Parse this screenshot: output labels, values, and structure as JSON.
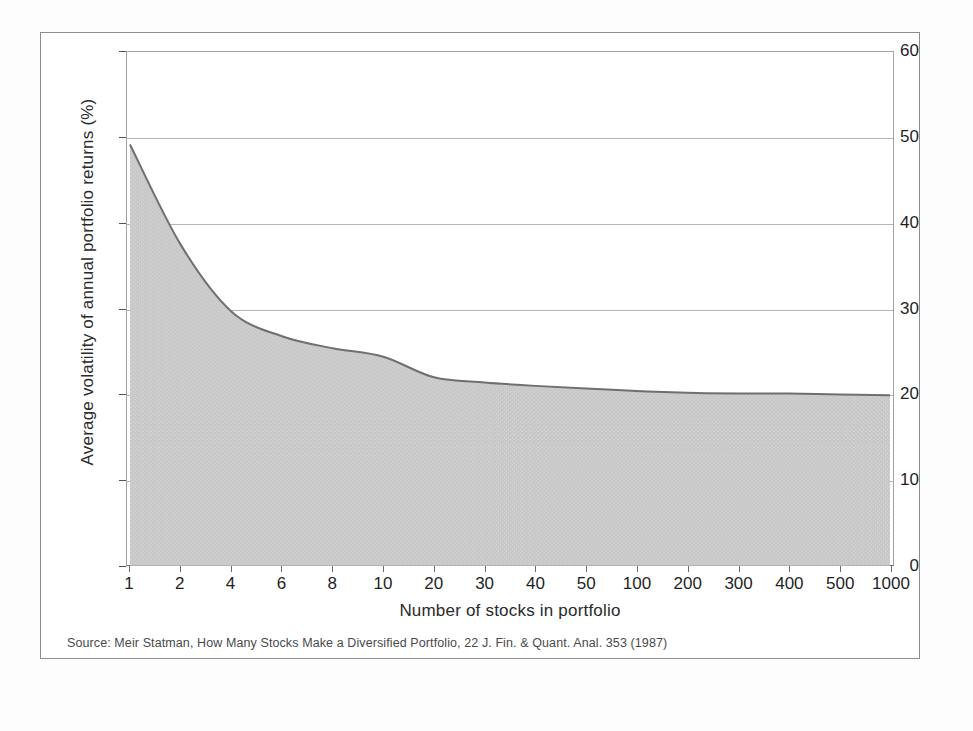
{
  "figure": {
    "source_note": "Source: Meir Statman, How Many Stocks Make a Diversified Portfolio, 22 J. Fin. & Quant. Anal. 353 (1987)",
    "frame_color": "#8e8e8e",
    "plot_border_color": "#a3a3a3",
    "gridline_color": "#b4b4b4",
    "fill_color": "#c8c8c8",
    "line_color": "#6f6f6f"
  },
  "chart_data": {
    "type": "area",
    "title": "",
    "xlabel": "Number of stocks in portfolio",
    "ylabel": "Average volatility of annual portfolio returns (%)",
    "categories": [
      "1",
      "2",
      "4",
      "6",
      "8",
      "10",
      "20",
      "30",
      "40",
      "50",
      "100",
      "200",
      "300",
      "400",
      "500",
      "1000"
    ],
    "values": [
      49.2,
      37.5,
      29.7,
      26.8,
      25.4,
      24.4,
      22.0,
      21.4,
      21.0,
      20.7,
      20.4,
      20.2,
      20.1,
      20.1,
      20.0,
      19.9
    ],
    "series": [
      {
        "name": "Average volatility of annual portfolio returns",
        "values": [
          49.2,
          37.5,
          29.7,
          26.8,
          25.4,
          24.4,
          22.0,
          21.4,
          21.0,
          20.7,
          20.4,
          20.2,
          20.1,
          20.1,
          20.0,
          19.9
        ]
      }
    ],
    "ylim": [
      0,
      60
    ],
    "y_ticks": [
      "0",
      "10",
      "20",
      "30",
      "40",
      "50",
      "60"
    ],
    "y_tick_values": [
      0,
      10,
      20,
      30,
      40,
      50,
      60
    ],
    "x_scale": "categorical",
    "grid": "horizontal",
    "legend": "none",
    "annotations": []
  }
}
